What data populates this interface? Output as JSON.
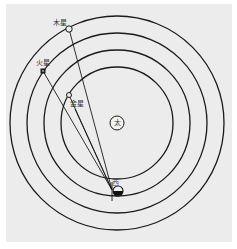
{
  "diagram": {
    "type": "planetary-orbit-diagram",
    "background_color": "#ececec",
    "line_color": "#1a1a1a",
    "sun": {
      "label": "太",
      "x": 117,
      "y": 123,
      "r": 7
    },
    "orbits": [
      {
        "name": "venus-orbit",
        "r": 56
      },
      {
        "name": "earth-orbit",
        "r": 73
      },
      {
        "name": "mars-orbit",
        "r": 90
      },
      {
        "name": "jupiter-orbit",
        "r": 107
      }
    ],
    "earth": {
      "label": "西",
      "x": 118,
      "y": 191,
      "r": 5
    },
    "planets": [
      {
        "name": "jupiter",
        "label": "木星",
        "x": 69,
        "y": 29
      },
      {
        "name": "mars",
        "label": "火星",
        "x": 43,
        "y": 71
      },
      {
        "name": "venus",
        "label": "金星",
        "x": 69,
        "y": 95
      }
    ]
  }
}
